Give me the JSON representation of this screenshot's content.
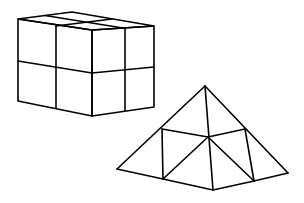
{
  "figure": {
    "stroke_color": "#000000",
    "background_color": "#ffffff"
  },
  "shapes": [
    {
      "name": "cuboid",
      "label": "",
      "cells": "2x2x2"
    },
    {
      "name": "pyramid",
      "label": "",
      "subdivided": true
    }
  ]
}
